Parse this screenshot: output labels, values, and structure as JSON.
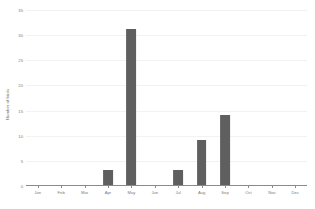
{
  "chart_data": {
    "type": "bar",
    "title": "",
    "xlabel": "",
    "ylabel": "Number of birds",
    "categories": [
      "Jan",
      "Feb",
      "Mar",
      "Apr",
      "May",
      "Jun",
      "Jul",
      "Aug",
      "Sep",
      "Oct",
      "Nov",
      "Dec"
    ],
    "values": [
      0,
      0,
      0,
      3,
      31,
      0,
      3,
      9,
      14,
      0,
      0,
      0
    ],
    "ylim": [
      0,
      35
    ],
    "yticks": [
      0,
      5,
      10,
      15,
      20,
      25,
      30,
      35
    ],
    "ytick_labels": [
      "0",
      "5",
      "10",
      "15",
      "20",
      "25",
      "30",
      "35"
    ],
    "grid": true,
    "legend": "none",
    "bar_color": "#5f5f5f"
  },
  "style": {
    "background": "#ffffff",
    "axis_color": "#8a8a8a",
    "grid_color": "#f2f2f2",
    "tick_text_color": "#7a7a7a"
  }
}
